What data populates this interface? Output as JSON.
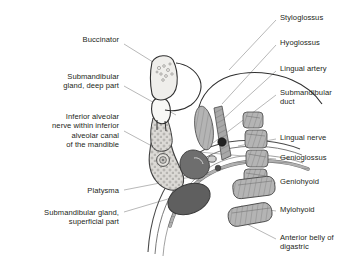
{
  "figure": {
    "background_color": "#ffffff",
    "line_color": "#231f20",
    "leader_color": "#9a9a9a",
    "palette": {
      "bone_light": "#e9e8e6",
      "muscle_mid": "#a8a8a8",
      "muscle_dark": "#6e6e6e",
      "gland_dark": "#5f5f5f",
      "gland_mid": "#8a8a8a",
      "vessel_black": "#2b2b2b",
      "tooth_white": "#f7f7f5",
      "fascia_grey": "#bdbdbd"
    }
  },
  "labels": {
    "left": [
      {
        "id": "buccinator",
        "text": "Buccinator",
        "x": 45,
        "y": 35,
        "width": 74,
        "align": "right",
        "leader": "M124,44 L169,72"
      },
      {
        "id": "submandibular-gland-deep-part",
        "text": "Submandibular\ngland, deep part",
        "x": 24,
        "y": 72,
        "width": 95,
        "align": "right",
        "leader": "M124,86 L176,115"
      },
      {
        "id": "inferior-alveolar-nerve",
        "text": "Inferior alveolar\nnerve within inferior\nalveolar canal\nof the mandible",
        "x": 11,
        "y": 112,
        "width": 108,
        "align": "right",
        "leader": "M124,131 L163,152"
      },
      {
        "id": "platysma",
        "text": "Platysma",
        "x": 54,
        "y": 186,
        "width": 65,
        "align": "right",
        "leader": "M124,190 L196,176"
      },
      {
        "id": "submandibular-gland-superficial-part",
        "text": "Submandibular gland,\nsuperficial part",
        "x": 5,
        "y": 208,
        "width": 114,
        "align": "right",
        "leader": "M124,212 L178,196"
      }
    ],
    "right": [
      {
        "id": "styloglossus",
        "text": "Styloglossus",
        "x": 280,
        "y": 13,
        "width": 72,
        "align": "left",
        "leader": "M276,20 L229,70"
      },
      {
        "id": "hyoglossus",
        "text": "Hyoglossus",
        "x": 280,
        "y": 38,
        "width": 72,
        "align": "left",
        "leader": "M276,45 L222,104"
      },
      {
        "id": "lingual-artery",
        "text": "Lingual artery",
        "x": 280,
        "y": 64,
        "width": 72,
        "align": "left",
        "leader": "M276,71 L221,121"
      },
      {
        "id": "submandibular-duct",
        "text": "Submandibular\nduct",
        "x": 280,
        "y": 88,
        "width": 72,
        "align": "left",
        "leader": "M276,95 L213,143"
      },
      {
        "id": "lingual-nerve",
        "text": "Lingual nerve",
        "x": 280,
        "y": 133,
        "width": 72,
        "align": "left",
        "leader": "M276,139 L238,146"
      },
      {
        "id": "genioglossus",
        "text": "Genioglossus",
        "x": 280,
        "y": 153,
        "width": 72,
        "align": "left",
        "leader": "M276,159 L199,152"
      },
      {
        "id": "geniohyoid",
        "text": "Geniohyoid",
        "x": 280,
        "y": 177,
        "width": 72,
        "align": "left",
        "leader": "M276,183 L246,180"
      },
      {
        "id": "mylohyoid",
        "text": "Mylohyoid",
        "x": 280,
        "y": 205,
        "width": 72,
        "align": "left",
        "leader": "M276,211 L241,206"
      },
      {
        "id": "anterior-belly-of-digastric",
        "text": "Anterior belly of\ndigastric",
        "x": 280,
        "y": 233,
        "width": 74,
        "align": "left",
        "leader": "M276,239 L237,219"
      }
    ]
  }
}
